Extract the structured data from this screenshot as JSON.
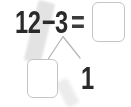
{
  "equation": {
    "minuend": "12",
    "operator": "−",
    "subtrahend": "3",
    "equals": "=",
    "result_value": ""
  },
  "decomposition": {
    "part1_value": "",
    "part2": "1"
  },
  "colors": {
    "digit": "#2a2a2a",
    "equals_sign": "#3c3c3c",
    "branch_line": "#b7b7b7",
    "box_border": "#c5c5c5",
    "box_fill": "#ffffff",
    "highlight_band": "#e3e3e3",
    "highlight_band_echo": "#ececec",
    "background": "#ffffff"
  }
}
